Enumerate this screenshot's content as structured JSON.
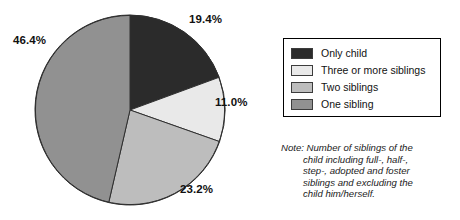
{
  "chart_data": {
    "type": "pie",
    "title": "",
    "subtitle": "",
    "xlabel": "",
    "ylabel": "",
    "grid": false,
    "legend_position": "right",
    "start_angle_deg": 0,
    "direction": "clockwise",
    "units": "percent",
    "total": 100.0,
    "categories": [
      "Only child",
      "Three or more siblings",
      "Two siblings",
      "One sibling"
    ],
    "values": [
      19.4,
      11.0,
      23.2,
      46.4
    ],
    "labels": [
      "19.4%",
      "11.0%",
      "23.2%",
      "46.4%"
    ],
    "colors": [
      "#2b2b2b",
      "#e9e9e9",
      "#bdbdbd",
      "#919191"
    ],
    "slices": [
      {
        "name": "Only child",
        "value": 19.4,
        "label": "19.4%",
        "color": "#2b2b2b"
      },
      {
        "name": "Three or more siblings",
        "value": 11.0,
        "label": "11.0%",
        "color": "#e9e9e9"
      },
      {
        "name": "Two siblings",
        "value": 23.2,
        "label": "23.2%",
        "color": "#bdbdbd"
      },
      {
        "name": "One sibling",
        "value": 46.4,
        "label": "46.4%",
        "color": "#919191"
      }
    ]
  },
  "legend": {
    "items": [
      {
        "label": "Only child",
        "color": "#2b2b2b"
      },
      {
        "label": "Three or more siblings",
        "color": "#e9e9e9"
      },
      {
        "label": "Two siblings",
        "color": "#bdbdbd"
      },
      {
        "label": "One sibling",
        "color": "#919191"
      }
    ]
  },
  "note": {
    "lines": [
      "Note: Number of siblings of the",
      "child including full-, half-,",
      "step-, adopted and foster",
      "siblings and excluding the",
      "child him/herself."
    ]
  }
}
